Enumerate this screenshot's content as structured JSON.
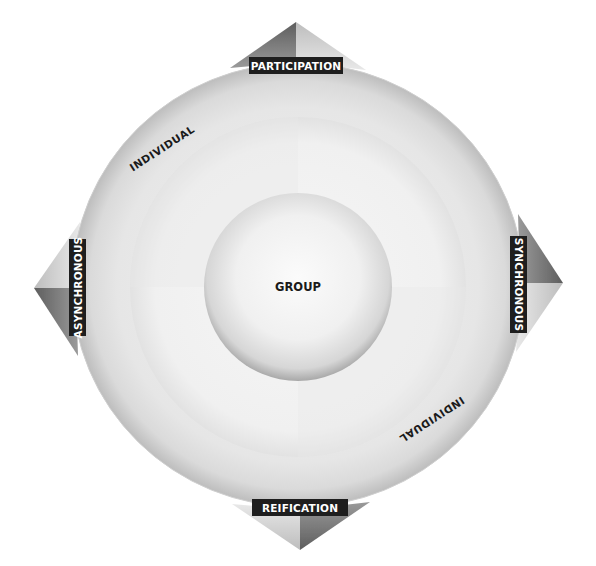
{
  "diagram": {
    "center_label": "GROUP",
    "ring_labels": {
      "upper_left": "INDIVIDUAL",
      "lower_right": "INDIVIDUAL"
    },
    "axis_labels": {
      "top": "PARTICIPATION",
      "bottom": "REIFICATION",
      "left": "ASYNCHRONOUS",
      "right": "SYNCHRONOUS"
    },
    "colors": {
      "background": "#ffffff",
      "outer_ring": "#d9d9d9",
      "middle_ring": "#ececec",
      "inner_circle": "#f5f5f5",
      "label_box": "#1e1e1e",
      "label_text": "#ffffff",
      "ring_text": "#1a1a1a",
      "arrow_dark": "#6e6e6e",
      "arrow_light": "#c4c4c4"
    }
  }
}
